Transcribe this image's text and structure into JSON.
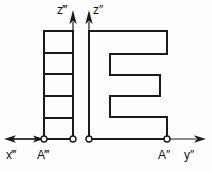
{
  "figure": {
    "background_color": "#fefefe",
    "line_color": "#1a1a1a",
    "text_color": "#111111"
  },
  "labels": {
    "z_third": "z‴",
    "z_second": "z″",
    "x_third": "x‴",
    "a_third": "A‴",
    "a_second": "A″",
    "y_second": "y″"
  },
  "axes": {
    "baseline_y": 139,
    "left_arrow_tip_x": 4,
    "right_arrow_tip_x": 206,
    "vertical_arrow_tip_y": 12,
    "z_third_axis_x": 73,
    "z_second_axis_x": 89
  },
  "nodes": [
    {
      "name": "left-view-origin-left",
      "x": 44,
      "y": 139
    },
    {
      "name": "left-view-origin-right",
      "x": 73,
      "y": 139
    },
    {
      "name": "front-view-origin-left",
      "x": 89,
      "y": 139
    },
    {
      "name": "front-view-origin-right",
      "x": 167,
      "y": 139
    }
  ],
  "left_view": {
    "name": "side-view-ladder",
    "x_left": 44,
    "x_right": 73,
    "y_top": 31,
    "y_bottom": 139,
    "divider_count": 4,
    "dividers_y": [
      53,
      74,
      96,
      118
    ]
  },
  "front_view": {
    "name": "front-view-e-shape",
    "x_left": 89,
    "x_right": 167,
    "x_notch": 110,
    "x_notch_right": 160,
    "y_top": 31,
    "y_bottom": 139,
    "notch_top_1": 54,
    "notch_bottom_1": 75,
    "notch_top_2": 96,
    "notch_bottom_2": 117
  }
}
